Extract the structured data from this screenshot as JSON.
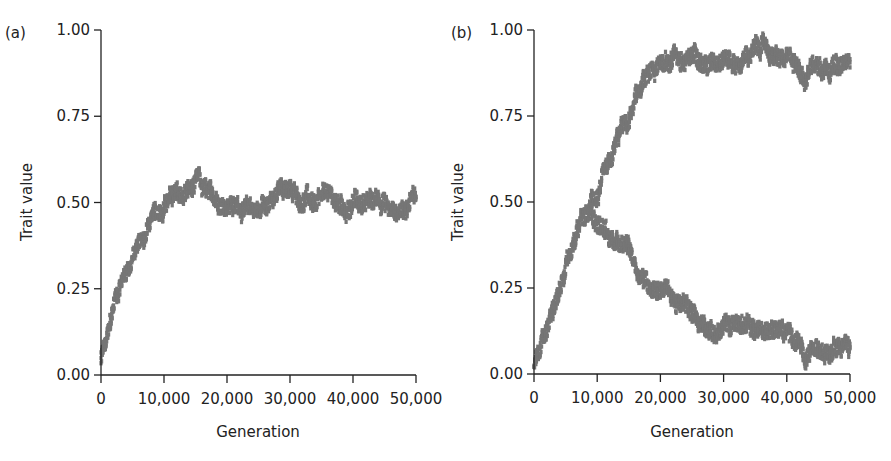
{
  "chart_data": [
    {
      "type": "scatter",
      "panel_label": "(a)",
      "title": "",
      "xlabel": "Generation",
      "ylabel": "Trait value",
      "xlim": [
        0,
        50000
      ],
      "ylim": [
        0,
        1
      ],
      "xticks": [
        0,
        10000,
        20000,
        30000,
        40000,
        50000
      ],
      "xtick_labels": [
        "0",
        "10,000",
        "20,000",
        "30,000",
        "40,000",
        "50,000"
      ],
      "yticks": [
        0,
        0.25,
        0.5,
        0.75,
        1.0
      ],
      "ytick_labels": [
        "0.00",
        "0.25",
        "0.50",
        "0.75",
        "1.00"
      ],
      "grid": false,
      "color": "#767676",
      "series": [
        {
          "name": "trait",
          "x": [
            0,
            1000,
            2000,
            3000,
            4000,
            5000,
            6000,
            7000,
            8000,
            9000,
            10000,
            12000,
            14000,
            15500,
            17000,
            20000,
            23000,
            25000,
            27000,
            29000,
            30000,
            32000,
            34000,
            36000,
            38000,
            40000,
            42000,
            44000,
            46000,
            48000,
            50000
          ],
          "y": [
            0.04,
            0.12,
            0.2,
            0.26,
            0.31,
            0.35,
            0.38,
            0.41,
            0.44,
            0.47,
            0.49,
            0.52,
            0.53,
            0.56,
            0.52,
            0.5,
            0.49,
            0.48,
            0.51,
            0.54,
            0.53,
            0.5,
            0.49,
            0.52,
            0.48,
            0.5,
            0.5,
            0.5,
            0.49,
            0.48,
            0.52
          ]
        }
      ]
    },
    {
      "type": "scatter",
      "panel_label": "(b)",
      "title": "",
      "xlabel": "Generation",
      "ylabel": "Trait value",
      "xlim": [
        0,
        50000
      ],
      "ylim": [
        0,
        1
      ],
      "xticks": [
        0,
        10000,
        20000,
        30000,
        40000,
        50000
      ],
      "xtick_labels": [
        "0",
        "10,000",
        "20,000",
        "30,000",
        "40,000",
        "50,000"
      ],
      "yticks": [
        0,
        0.25,
        0.5,
        0.75,
        1.0
      ],
      "ytick_labels": [
        "0.00",
        "0.25",
        "0.50",
        "0.75",
        "1.00"
      ],
      "grid": false,
      "color": "#767676",
      "series": [
        {
          "name": "shared-branch",
          "x": [
            0,
            1000,
            2000,
            3000,
            4000,
            5000,
            6000,
            7000,
            8000,
            9000
          ],
          "y": [
            0.03,
            0.08,
            0.13,
            0.19,
            0.26,
            0.31,
            0.36,
            0.41,
            0.45,
            0.49
          ]
        },
        {
          "name": "upper-branch",
          "x": [
            9000,
            10000,
            11000,
            12000,
            13000,
            14000,
            15000,
            16000,
            17000,
            18000,
            19000,
            20000,
            22000,
            24000,
            26000,
            28000,
            30000,
            32000,
            34000,
            36000,
            38000,
            40000,
            42000,
            43000,
            44000,
            46000,
            48000,
            50000
          ],
          "y": [
            0.5,
            0.53,
            0.57,
            0.61,
            0.66,
            0.71,
            0.74,
            0.79,
            0.83,
            0.86,
            0.88,
            0.9,
            0.93,
            0.92,
            0.92,
            0.91,
            0.93,
            0.91,
            0.93,
            0.95,
            0.92,
            0.91,
            0.89,
            0.86,
            0.91,
            0.9,
            0.9,
            0.9
          ]
        },
        {
          "name": "lower-branch",
          "x": [
            9000,
            10000,
            11000,
            12000,
            13000,
            14000,
            15000,
            16000,
            17000,
            18000,
            19000,
            20000,
            22000,
            24000,
            25000,
            26000,
            27000,
            28000,
            30000,
            32000,
            34000,
            36000,
            38000,
            40000,
            42000,
            43000,
            44000,
            46000,
            48000,
            50000
          ],
          "y": [
            0.49,
            0.45,
            0.43,
            0.41,
            0.38,
            0.35,
            0.34,
            0.31,
            0.29,
            0.27,
            0.25,
            0.25,
            0.22,
            0.2,
            0.19,
            0.16,
            0.14,
            0.13,
            0.13,
            0.14,
            0.13,
            0.12,
            0.14,
            0.12,
            0.09,
            0.03,
            0.07,
            0.08,
            0.1,
            0.07
          ]
        }
      ]
    }
  ],
  "layout": {
    "panels": [
      {
        "x0": 101,
        "x1": 416,
        "y0": 375,
        "y1": 30
      },
      {
        "x0": 534,
        "x1": 850,
        "y0": 374,
        "y1": 30
      }
    ]
  }
}
